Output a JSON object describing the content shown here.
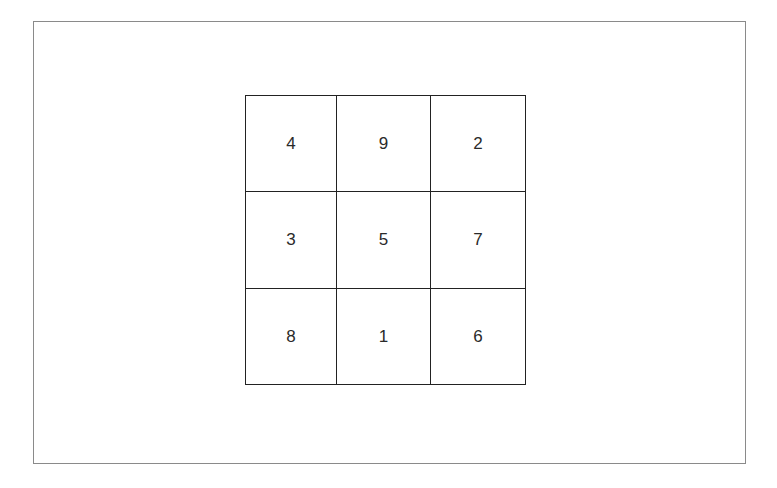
{
  "diagram": {
    "type": "magic-square",
    "rows": [
      [
        "4",
        "9",
        "2"
      ],
      [
        "3",
        "5",
        "7"
      ],
      [
        "8",
        "1",
        "6"
      ]
    ]
  }
}
